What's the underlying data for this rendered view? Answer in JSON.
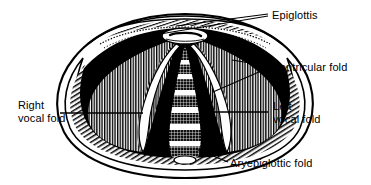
{
  "figure": {
    "background_color": "#ffffff",
    "ink_color": "#000000",
    "style": "black-and-white line engraving / hatched medical illustration"
  },
  "labels": [
    {
      "id": "epiglottis",
      "text": "Epiglottis",
      "lines": [
        "Epiglottis"
      ],
      "x": 272,
      "y": 9,
      "align": "left"
    },
    {
      "id": "ventricular-fold",
      "text": "Ventricular fold",
      "lines": [
        "Ventricular fold"
      ],
      "x": 273,
      "y": 61,
      "align": "left"
    },
    {
      "id": "right-vocal-fold",
      "text": "Right vocal fold",
      "lines": [
        "Right",
        "vocal fold"
      ],
      "x": 18,
      "y": 99,
      "align": "left"
    },
    {
      "id": "left-vocal-fold",
      "text": "Left vocal fold",
      "lines": [
        "Left",
        "vocal fold"
      ],
      "x": 273,
      "y": 100,
      "align": "left"
    },
    {
      "id": "aryepiglottic-fold",
      "text": "Aryepiglottic fold",
      "lines": [
        "Aryepiglottic fold"
      ],
      "x": 230,
      "y": 157,
      "align": "left"
    }
  ],
  "leaders": [
    {
      "id": "leader-epiglottis-upper",
      "from": [
        268,
        14
      ],
      "to": [
        176,
        26
      ]
    },
    {
      "id": "leader-epiglottis-lower",
      "from": [
        268,
        16
      ],
      "to": [
        160,
        34
      ]
    },
    {
      "id": "leader-ventricular-upper",
      "from": [
        268,
        66
      ],
      "to": [
        232,
        60
      ]
    },
    {
      "id": "leader-ventricular-lower",
      "from": [
        268,
        68
      ],
      "to": [
        213,
        92
      ]
    },
    {
      "id": "leader-right-vocal-fold",
      "from": [
        60,
        113
      ],
      "to": [
        143,
        113
      ]
    },
    {
      "id": "leader-left-vocal-fold",
      "from": [
        268,
        112
      ],
      "to": [
        200,
        112
      ]
    },
    {
      "id": "leader-aryepiglottic-fold",
      "from": [
        228,
        162
      ],
      "to": [
        196,
        149
      ]
    }
  ],
  "anatomy": {
    "parts": [
      {
        "id": "epiglottis-arch",
        "name": "Epiglottis",
        "description": "Arched band across the top of the aperture with stippled free margin"
      },
      {
        "id": "ventricular-fold-left",
        "name": "Ventricular fold (right of image)",
        "description": "Vertically hatched fold lateral to the vocal fold"
      },
      {
        "id": "ventricular-fold-right",
        "name": "Ventricular fold (left of image)",
        "description": "Vertically hatched fold lateral to the vocal fold"
      },
      {
        "id": "vocal-fold-right",
        "name": "Right vocal fold",
        "description": "Pale white band bordering the glottic opening"
      },
      {
        "id": "vocal-fold-left",
        "name": "Left vocal fold",
        "description": "Pale white band bordering the glottic opening"
      },
      {
        "id": "aryepiglottic-fold",
        "name": "Aryepiglottic fold",
        "description": "Thick hatched rim sweeping around the lower circumference"
      },
      {
        "id": "glottis",
        "name": "Glottic aperture",
        "description": "Dark central airway"
      },
      {
        "id": "trachea",
        "name": "Tracheal rings",
        "description": "Stack of pale horizontal rings seen through the open glottis"
      }
    ],
    "tracheal_ring_count": 6
  }
}
